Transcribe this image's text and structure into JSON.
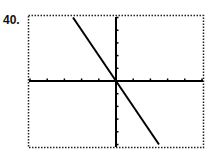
{
  "problem_number": "40.",
  "chart_data": {
    "type": "line",
    "title": "",
    "xlabel": "",
    "ylabel": "",
    "xlim": [
      -5,
      5
    ],
    "ylim": [
      -5,
      5
    ],
    "x_ticks": [
      -5,
      -4,
      -3,
      -2,
      -1,
      1,
      2,
      3,
      4,
      5
    ],
    "y_ticks": [
      -5,
      -4,
      -3,
      -2,
      -1,
      1,
      2,
      3,
      4,
      5
    ],
    "tick_labels_shown": false,
    "grid": false,
    "frame": "dotted",
    "series": [
      {
        "name": "y = -2x",
        "equation": "y = -2x",
        "x": [
          -2.5,
          0,
          2.5
        ],
        "y": [
          5,
          0,
          -5
        ]
      }
    ]
  }
}
